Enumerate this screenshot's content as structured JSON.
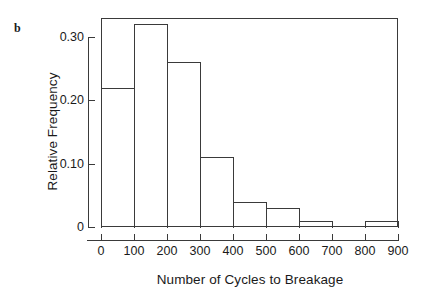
{
  "panel": {
    "letter": "b"
  },
  "chart_data": {
    "type": "bar",
    "title": "",
    "subtitle": "",
    "xlabel": "Number of Cycles to Breakage",
    "ylabel": "Relative Frequency",
    "xlim": [
      0,
      900
    ],
    "ylim": [
      0,
      0.33
    ],
    "grid": false,
    "legend": false,
    "bin_width": 100,
    "bin_edges": [
      0,
      100,
      200,
      300,
      400,
      500,
      600,
      700,
      800,
      900
    ],
    "categories": [
      "0-100",
      "100-200",
      "200-300",
      "300-400",
      "400-500",
      "500-600",
      "600-700",
      "700-800",
      "800-900"
    ],
    "values": [
      0.22,
      0.32,
      0.26,
      0.11,
      0.04,
      0.03,
      0.01,
      0.0,
      0.01
    ],
    "xticks": [
      "0",
      "100",
      "200",
      "300",
      "400",
      "500",
      "600",
      "700",
      "800",
      "900"
    ],
    "xtick_values": [
      0,
      100,
      200,
      300,
      400,
      500,
      600,
      700,
      800,
      900
    ],
    "yticks": [
      "0",
      "0.10",
      "0.20",
      "0.30"
    ],
    "ytick_values": [
      0,
      0.1,
      0.2,
      0.3
    ],
    "bar_edge_color": "#3a3a3a",
    "bar_fill_color": "transparent",
    "axis_color": "#3a3a3a"
  }
}
